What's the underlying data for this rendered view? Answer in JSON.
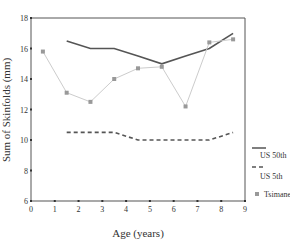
{
  "chart_data": {
    "type": "line",
    "title": "",
    "xlabel": "Age (years)",
    "ylabel": "Sum of Skinfolds (mm)",
    "xlim": [
      0,
      9
    ],
    "ylim": [
      6,
      18
    ],
    "xticks": [
      "0",
      "1",
      "2",
      "3",
      "4",
      "5",
      "6",
      "7",
      "8",
      "9"
    ],
    "yticks": [
      "6",
      "8",
      "10",
      "12",
      "14",
      "16",
      "18"
    ],
    "grid": false,
    "legend_position": "right",
    "series": [
      {
        "name": "US 50th",
        "style": "solid",
        "color": "#555555",
        "x": [
          1.5,
          2.5,
          3.5,
          4.5,
          5.5,
          6.5,
          7.5,
          8.5
        ],
        "values": [
          16.5,
          16,
          16,
          15.5,
          15,
          15.5,
          16,
          17
        ]
      },
      {
        "name": "US 5th",
        "style": "dashed",
        "color": "#555555",
        "x": [
          1.5,
          2.5,
          3.5,
          4.5,
          5.5,
          6.5,
          7.5,
          8.5
        ],
        "values": [
          10.5,
          10.5,
          10.5,
          10,
          10,
          10,
          10,
          10.5
        ]
      },
      {
        "name": "Tsimane",
        "style": "light-with-markers",
        "color": "#cccccc",
        "marker_color": "#999999",
        "x": [
          0.5,
          1.5,
          2.5,
          3.5,
          4.5,
          5.5,
          6.5,
          7.5,
          8.5
        ],
        "values": [
          15.8,
          13.1,
          12.5,
          14,
          14.7,
          14.8,
          12.2,
          16.4,
          16.6
        ]
      }
    ]
  },
  "legend": {
    "us50": "US 50th",
    "us5": "US 5th",
    "tsimane": "Tsimane"
  }
}
